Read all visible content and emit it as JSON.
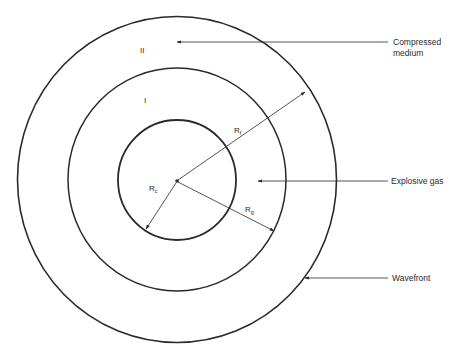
{
  "diagram": {
    "colors": {
      "ink": "#2a2a2a",
      "background": "#ffffff"
    },
    "regions": {
      "outer": {
        "label": "II"
      },
      "inner": {
        "label": "I"
      }
    },
    "radii": {
      "rf": {
        "symbol": "R",
        "subscript": "f"
      },
      "rg": {
        "symbol": "R",
        "subscript": "g"
      },
      "rc": {
        "symbol": "R",
        "subscript": "c"
      }
    },
    "annotations": [
      {
        "id": "compressed",
        "line1": "Compressed",
        "line2": "medium"
      },
      {
        "id": "explosive",
        "line1": "Explosive gas"
      },
      {
        "id": "wavefront",
        "line1": "Wavefront"
      }
    ]
  }
}
